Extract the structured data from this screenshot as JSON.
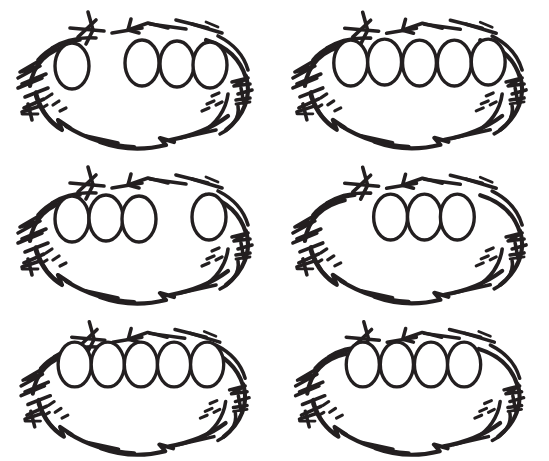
{
  "image": {
    "subject": "hand-drawn bird nests with eggs",
    "style": "black ink line drawing on white background",
    "background_color": "#ffffff",
    "ink_color": "#231f20",
    "grid_rows": 3,
    "grid_columns": 2,
    "panel_count": 6
  },
  "panels": [
    {
      "id": "nest-1",
      "position": "row-1-left",
      "egg_count": 4,
      "arrangement": "one egg separated on the left, three eggs grouped on the right",
      "eggs": [
        {
          "cx": 72,
          "cy": 66,
          "rx": 17,
          "ry": 23
        },
        {
          "cx": 142,
          "cy": 63,
          "rx": 17,
          "ry": 23
        },
        {
          "cx": 177,
          "cy": 64,
          "rx": 17,
          "ry": 23
        },
        {
          "cx": 210,
          "cy": 65,
          "rx": 17,
          "ry": 23
        }
      ]
    },
    {
      "id": "nest-2",
      "position": "row-1-right",
      "egg_count": 5,
      "arrangement": "five eggs evenly grouped across the nest",
      "eggs": [
        {
          "cx": 76,
          "cy": 63,
          "rx": 17,
          "ry": 23
        },
        {
          "cx": 110,
          "cy": 62,
          "rx": 17,
          "ry": 23
        },
        {
          "cx": 145,
          "cy": 63,
          "rx": 17,
          "ry": 23
        },
        {
          "cx": 180,
          "cy": 63,
          "rx": 17,
          "ry": 23
        },
        {
          "cx": 214,
          "cy": 62,
          "rx": 17,
          "ry": 23
        }
      ]
    },
    {
      "id": "nest-3",
      "position": "row-2-left",
      "egg_count": 4,
      "arrangement": "three eggs grouped on the left, one egg separated on the right",
      "eggs": [
        {
          "cx": 72,
          "cy": 64,
          "rx": 17,
          "ry": 23
        },
        {
          "cx": 106,
          "cy": 63,
          "rx": 17,
          "ry": 23
        },
        {
          "cx": 139,
          "cy": 64,
          "rx": 17,
          "ry": 23
        },
        {
          "cx": 209,
          "cy": 62,
          "rx": 17,
          "ry": 23
        }
      ]
    },
    {
      "id": "nest-4",
      "position": "row-2-right",
      "egg_count": 3,
      "arrangement": "three eggs grouped in the centre of the nest",
      "eggs": [
        {
          "cx": 116,
          "cy": 62,
          "rx": 17,
          "ry": 23
        },
        {
          "cx": 150,
          "cy": 62,
          "rx": 17,
          "ry": 23
        },
        {
          "cx": 183,
          "cy": 62,
          "rx": 17,
          "ry": 23
        }
      ]
    },
    {
      "id": "nest-5",
      "position": "row-3-left",
      "egg_count": 5,
      "arrangement": "five eggs evenly grouped across the nest",
      "eggs": [
        {
          "cx": 73,
          "cy": 56,
          "rx": 17,
          "ry": 23
        },
        {
          "cx": 107,
          "cy": 56,
          "rx": 17,
          "ry": 23
        },
        {
          "cx": 141,
          "cy": 56,
          "rx": 17,
          "ry": 23
        },
        {
          "cx": 175,
          "cy": 56,
          "rx": 17,
          "ry": 23
        },
        {
          "cx": 209,
          "cy": 56,
          "rx": 17,
          "ry": 23
        }
      ]
    },
    {
      "id": "nest-6",
      "position": "row-3-right",
      "egg_count": 4,
      "arrangement": "four eggs grouped slightly left of centre",
      "eggs": [
        {
          "cx": 87,
          "cy": 56,
          "rx": 17,
          "ry": 23
        },
        {
          "cx": 122,
          "cy": 56,
          "rx": 17,
          "ry": 23
        },
        {
          "cx": 157,
          "cy": 56,
          "rx": 17,
          "ry": 23
        },
        {
          "cx": 191,
          "cy": 56,
          "rx": 17,
          "ry": 23
        }
      ]
    }
  ]
}
